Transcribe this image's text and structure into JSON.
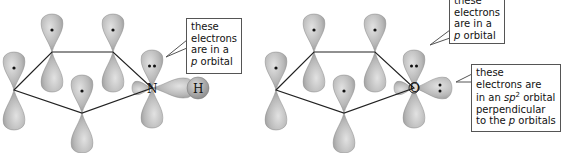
{
  "diagrams": [
    {
      "name": "pyrrole",
      "heteroatom": "N",
      "substituent": "H",
      "callouts": [
        {
          "lines": [
            "these",
            "electrons",
            "are in a"
          ],
          "italic_prefix": "p",
          "last_line_rest": " orbital"
        }
      ]
    },
    {
      "name": "furan",
      "heteroatom": "O",
      "callouts": [
        {
          "lines": [
            "these",
            "electrons",
            "are in a"
          ],
          "italic_prefix": "p",
          "last_line_rest": " orbital"
        },
        {
          "lines": [
            "these",
            "electrons are"
          ],
          "sp2_line": {
            "pre": "in an ",
            "sp": "sp",
            "sup": "2",
            "post": " orbital"
          },
          "line4": "perpendicular",
          "line5_pre": "to the ",
          "line5_italic": "p",
          "line5_post": " orbitals"
        }
      ]
    }
  ],
  "colors": {
    "orbital_fill": "#b5b5b5",
    "orbital_highlight": "#dcdcdc",
    "bond": "#222222",
    "electron": "#111111"
  }
}
